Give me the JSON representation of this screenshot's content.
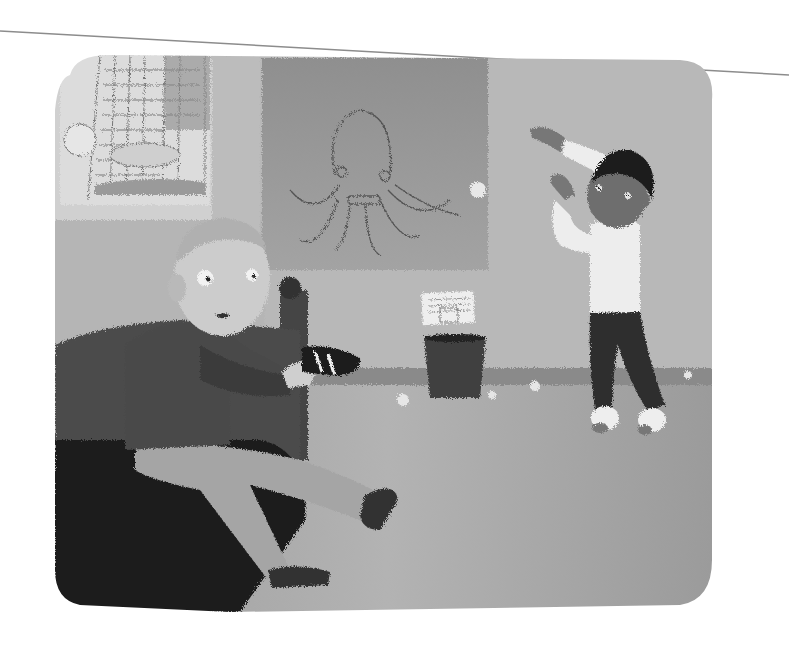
{
  "illustration": {
    "style": "grayscale children's book illustration",
    "description": "Bedroom scene: a boy sitting on a bed putting on a sneaker while another boy dances in socks on the carpet",
    "colors": {
      "page": "#ffffff",
      "wall_left": "#c7c7c7",
      "wall_right": "#b9b9b9",
      "octopus_poster": "#9c9c9c",
      "bed_dark": "#3a3a3a",
      "bed_blanket": "#4d4d4d",
      "floor_strip": "#8a8a8a",
      "carpet": "#a9a9a9",
      "sweater": "#4a4a4a",
      "pants_light": "#a6a6a6",
      "skin_light": "#cfcfcf",
      "skin_dark": "#6e6e6e",
      "hair_dark": "#1c1c1c",
      "shirt_white": "#eeeeee",
      "pants_dark": "#2f2f2f",
      "trash_can": "#3f3f3f",
      "page_line": "#8c8c8c"
    },
    "elements": {
      "window_sketch": "sketch of a soccer goal net with goalkeeper diving and a ball",
      "poster": "octopus drawing on poster",
      "trash_can": "small dark trash can with paper note pinned above",
      "boy_left": "light-haired boy in dark sweater sitting on bed holding sneaker",
      "boy_right": "dark-haired boy in white shirt and dark pants dancing in socks",
      "paper_balls": "crumpled paper balls on the floor and in the air"
    }
  }
}
